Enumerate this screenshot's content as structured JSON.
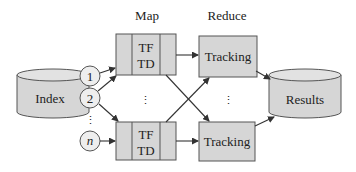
{
  "diagram": {
    "headers": {
      "map": "Map",
      "reduce": "Reduce"
    },
    "input": {
      "label": "Index"
    },
    "output": {
      "label": "Results"
    },
    "splits": [
      {
        "label": "1"
      },
      {
        "label": "2"
      },
      {
        "label": "n"
      }
    ],
    "mappers": [
      {
        "line1": "TF",
        "line2": "TD"
      },
      {
        "line1": "TF",
        "line2": "TD"
      }
    ],
    "reducers": [
      {
        "label": "Tracking"
      },
      {
        "label": "Tracking"
      }
    ],
    "ellipsis": "⋮",
    "colors": {
      "box_fill": "#d6d6d6",
      "box_stroke": "#555555",
      "arrow": "#333333",
      "text": "#222222"
    }
  }
}
